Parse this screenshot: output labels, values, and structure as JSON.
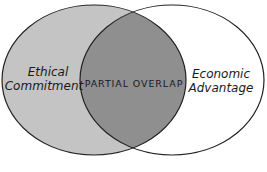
{
  "diagram": {
    "type": "venn",
    "sets": [
      {
        "label_line1": "Ethical",
        "label_line2": "Commitment",
        "fill": "#c4c4c4"
      },
      {
        "label_line1": "Economic",
        "label_line2": "Advantage",
        "fill": "#ffffff"
      }
    ],
    "intersection": {
      "label": "PARTIAL OVERLAP",
      "fill": "#8f8f8f"
    },
    "stroke": "#222222"
  }
}
